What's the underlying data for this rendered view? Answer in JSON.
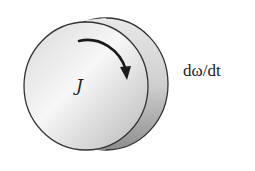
{
  "diagram": {
    "labels": {
      "inertia": "J",
      "angular_acceleration": "dω/dt"
    },
    "arrow": {
      "direction": "clockwise"
    },
    "colors": {
      "outline": "#333333",
      "face_light": "#f4f4f4",
      "face_dark": "#b5b5b5",
      "rim": "#c9c9c9",
      "arrow": "#1a1a1a"
    }
  }
}
